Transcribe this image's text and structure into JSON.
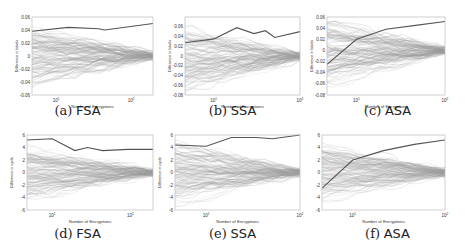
{
  "chart_data": [
    {
      "id": "a",
      "caption_letter": "(a)",
      "caption_name": "FSA",
      "type": "line",
      "xlabel": "Number of Encryptions",
      "ylabel": "Difference in labels",
      "xscale": "log",
      "xticks": [
        "10^1",
        "10^2"
      ],
      "ylim": [
        -0.06,
        0.06
      ],
      "yticks": [
        "0.06",
        "0.04",
        "0.02",
        "0",
        "-0.02",
        "-0.04",
        "-0.06"
      ],
      "highlight_series": {
        "x_frac": [
          0,
          0.3,
          0.55,
          0.6,
          0.8,
          1.0
        ],
        "y": [
          0.038,
          0.044,
          0.042,
          0.04,
          0.045,
          0.05
        ]
      },
      "band_start": 0.045,
      "band_end": 0.015,
      "grid": false
    },
    {
      "id": "b",
      "caption_letter": "(b)",
      "caption_name": "SSA",
      "type": "line",
      "xlabel": "Number of Encryptions",
      "ylabel": "Difference in labels",
      "xscale": "log",
      "xticks": [
        "10^1",
        "10^2"
      ],
      "ylim": [
        -0.08,
        0.08
      ],
      "yticks": [
        "0.06",
        "0.04",
        "0.02",
        "0",
        "-0.02",
        "-0.04",
        "-0.06",
        "-0.08"
      ],
      "highlight_series": {
        "x_frac": [
          0,
          0.25,
          0.45,
          0.6,
          0.7,
          0.78,
          1.0
        ],
        "y": [
          0.027,
          0.035,
          0.058,
          0.046,
          0.052,
          0.038,
          0.05
        ]
      },
      "band_start": 0.07,
      "band_end": 0.02,
      "grid": false
    },
    {
      "id": "c",
      "caption_letter": "(c)",
      "caption_name": "ASA",
      "type": "line",
      "xlabel": "Number of Encryptions",
      "ylabel": "Difference in labels",
      "xscale": "log",
      "xticks": [
        "10^1",
        "10^2"
      ],
      "ylim": [
        -0.08,
        0.06
      ],
      "yticks": [
        "0.06",
        "0.04",
        "0.02",
        "0",
        "-0.02",
        "-0.04",
        "-0.06",
        "-0.08"
      ],
      "highlight_series": {
        "x_frac": [
          0,
          0.25,
          0.5,
          0.75,
          1.0
        ],
        "y": [
          -0.025,
          0.02,
          0.038,
          0.045,
          0.052
        ]
      },
      "band_start": 0.06,
      "band_end": 0.015,
      "grid": false
    },
    {
      "id": "d",
      "caption_letter": "(d)",
      "caption_name": "FSA",
      "type": "line",
      "xlabel": "Number of Encryptions",
      "ylabel": "Difference in cycle",
      "xscale": "log",
      "xticks": [
        "10^1",
        "10^2"
      ],
      "ylim": [
        -6,
        6
      ],
      "yticks": [
        "6",
        "4",
        "2",
        "0",
        "-2",
        "-4",
        "-6"
      ],
      "highlight_series": {
        "x_frac": [
          0,
          0.2,
          0.38,
          0.48,
          0.6,
          0.8,
          1.0
        ],
        "y": [
          5.2,
          5.4,
          3.5,
          4.0,
          3.5,
          3.7,
          3.7
        ]
      },
      "band_start": 4.5,
      "band_end": 1.5,
      "grid": false
    },
    {
      "id": "e",
      "caption_letter": "(e)",
      "caption_name": "SSA",
      "type": "line",
      "xlabel": "Number of Encryptions",
      "ylabel": "Difference in cycle",
      "xscale": "log",
      "xticks": [
        "10^1",
        "10^2"
      ],
      "ylim": [
        -6,
        6
      ],
      "yticks": [
        "6",
        "4",
        "2",
        "0",
        "-2",
        "-4",
        "-6"
      ],
      "highlight_series": {
        "x_frac": [
          0,
          0.25,
          0.45,
          0.65,
          0.78,
          1.0
        ],
        "y": [
          4.4,
          4.2,
          5.6,
          5.6,
          5.4,
          6.0
        ]
      },
      "band_start": 5.0,
      "band_end": 1.5,
      "grid": false
    },
    {
      "id": "f",
      "caption_letter": "(f)",
      "caption_name": "ASA",
      "type": "line",
      "xlabel": "Number of Encryptions",
      "ylabel": "Difference in cycle",
      "xscale": "log",
      "xticks": [
        "10^1",
        "10^2"
      ],
      "ylim": [
        -6,
        6
      ],
      "yticks": [
        "6",
        "4",
        "2",
        "0",
        "-2",
        "-4",
        "-6"
      ],
      "highlight_series": {
        "x_frac": [
          0,
          0.25,
          0.5,
          0.75,
          1.0
        ],
        "y": [
          -2.5,
          2.0,
          3.5,
          4.5,
          5.2
        ]
      },
      "band_start": 4.5,
      "band_end": 1.5,
      "grid": false
    }
  ],
  "colors": {
    "highlight_line": "#555555",
    "band_lines": "#9a9a9a",
    "frame": "#bbbbbb",
    "text": "#333333"
  }
}
